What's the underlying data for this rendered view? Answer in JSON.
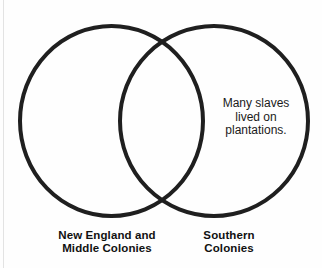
{
  "page": {
    "clipped_heading": "colonies?",
    "background_color": "#fefefe",
    "stroke_color": "#1f1f1f",
    "text_color": "#1a1a1a"
  },
  "diagram": {
    "type": "venn",
    "sets": 2,
    "left_set": {
      "label_line1": "New England and",
      "label_line2": "Middle Colonies",
      "content": ""
    },
    "right_set": {
      "label_line1": "Southern",
      "label_line2": "Colonies",
      "content_line1": "Many slaves",
      "content_line2": "lived on",
      "content_line3": "plantations."
    },
    "overlap": {
      "content": ""
    }
  }
}
